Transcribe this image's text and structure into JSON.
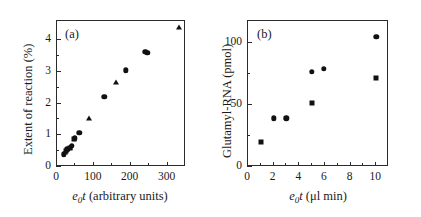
{
  "figure": {
    "background": "#ffffff",
    "marker_color": "#111111",
    "axis_color": "#2b2b2b"
  },
  "panel_a": {
    "label": "(a)",
    "ylabel_parts": {
      "text": "Extent of reaction (%)"
    },
    "xlabel_parts": {
      "e": "e",
      "zero": "0",
      "t": "t",
      "rest": " (arbitrary units)"
    },
    "xticks": [
      "0",
      "100",
      "200",
      "300"
    ],
    "yticks": [
      "0",
      "1",
      "2",
      "3",
      "4"
    ]
  },
  "panel_b": {
    "label": "(b)",
    "ylabel_parts": {
      "text": "Glutamyl-RNA (pmol)"
    },
    "xlabel_parts": {
      "e": "e",
      "zero": "0",
      "t": "t",
      "rest": " (μl min)"
    },
    "xticks": [
      "0",
      "2",
      "4",
      "6",
      "8",
      "10"
    ],
    "yticks": [
      "0",
      "50",
      "100"
    ]
  },
  "chart_data": [
    {
      "type": "scatter",
      "title": "(a)",
      "xlabel": "e0 t (arbitrary units)",
      "ylabel": "Extent of reaction (%)",
      "xlim": [
        0,
        350
      ],
      "ylim": [
        0,
        4.6
      ],
      "xticks": [
        0,
        100,
        200,
        300
      ],
      "yticks": [
        0,
        1,
        2,
        3,
        4
      ],
      "grid": false,
      "legend": "none",
      "series": [
        {
          "name": "circles",
          "marker": "circle",
          "points": [
            [
              18,
              0.4
            ],
            [
              28,
              0.56
            ],
            [
              40,
              0.66
            ],
            [
              48,
              0.9
            ],
            [
              60,
              1.08
            ],
            [
              128,
              2.22
            ],
            [
              186,
              3.05
            ],
            [
              240,
              3.62
            ],
            [
              245,
              3.6
            ]
          ]
        },
        {
          "name": "squares",
          "marker": "square",
          "points": [
            [
              24,
              0.5
            ],
            [
              34,
              0.6
            ],
            [
              46,
              0.89
            ]
          ]
        },
        {
          "name": "triangles",
          "marker": "triangle",
          "points": [
            [
              21,
              0.46
            ],
            [
              36,
              0.63
            ],
            [
              88,
              1.54
            ],
            [
              160,
              2.68
            ],
            [
              330,
              4.42
            ]
          ]
        }
      ]
    },
    {
      "type": "scatter",
      "title": "(b)",
      "xlabel": "e0 t (μl min)",
      "ylabel": "Glutamyl-RNA (pmol)",
      "xlim": [
        0,
        11
      ],
      "ylim": [
        0,
        118
      ],
      "xticks": [
        0,
        2,
        4,
        6,
        8,
        10
      ],
      "yticks": [
        0,
        50,
        100
      ],
      "grid": false,
      "legend": "none",
      "series": [
        {
          "name": "circles",
          "marker": "circle",
          "points": [
            [
              2.0,
              39.5
            ],
            [
              3.0,
              39.5
            ],
            [
              5.0,
              77.0
            ],
            [
              5.9,
              79.5
            ],
            [
              10.0,
              105.0
            ]
          ]
        },
        {
          "name": "squares",
          "marker": "square",
          "points": [
            [
              1.0,
              20.0
            ],
            [
              5.0,
              52.0
            ],
            [
              10.0,
              72.0
            ]
          ]
        }
      ]
    }
  ]
}
